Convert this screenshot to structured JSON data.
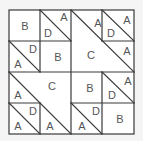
{
  "diagram": {
    "type": "tangram-grid-puzzle",
    "grid": {
      "rows": 4,
      "cols": 4
    },
    "colors": {
      "background": "#f5f5f5",
      "fill": "#ffffff",
      "stroke": "#3a3a3a",
      "text": "#555555"
    },
    "regions": [
      {
        "id": "r1",
        "label": "B",
        "shape": "square",
        "location": "row1-col1"
      },
      {
        "id": "r2",
        "label": "D",
        "shape": "triangle",
        "location": "row1-col2-lower-left"
      },
      {
        "id": "r3",
        "label": "A",
        "shape": "triangle",
        "location": "row1-col2-upper-right"
      },
      {
        "id": "r4",
        "label": "A",
        "shape": "triangle",
        "location": "top-right-block-top"
      },
      {
        "id": "r5",
        "label": "D",
        "shape": "triangle",
        "location": "row1-col4-lower-left"
      },
      {
        "id": "r6",
        "label": "A",
        "shape": "triangle",
        "location": "row1-col4-upper-right"
      },
      {
        "id": "r7",
        "label": "A",
        "shape": "triangle",
        "location": "row2-col4-upper-right"
      },
      {
        "id": "r8",
        "label": "C",
        "shape": "large-triangle",
        "location": "top-right-block-lower-left"
      },
      {
        "id": "r9",
        "label": "A",
        "shape": "triangle",
        "location": "row2-col1-lower-left"
      },
      {
        "id": "r10",
        "label": "D",
        "shape": "triangle",
        "location": "row2-col1-upper-right"
      },
      {
        "id": "r11",
        "label": "B",
        "shape": "square",
        "location": "row2-col2"
      },
      {
        "id": "r12",
        "label": "C",
        "shape": "large-triangle",
        "location": "bottom-left-block-upper-right"
      },
      {
        "id": "r13",
        "label": "A",
        "shape": "triangle",
        "location": "row3-col1-lower-left"
      },
      {
        "id": "r14",
        "label": "B",
        "shape": "square",
        "location": "row3-col3"
      },
      {
        "id": "r15",
        "label": "D",
        "shape": "triangle",
        "location": "row3-col4-lower-left"
      },
      {
        "id": "r16",
        "label": "A",
        "shape": "triangle",
        "location": "row3-col4-upper-right"
      },
      {
        "id": "r17",
        "label": "A",
        "shape": "triangle",
        "location": "row4-col1-lower-left"
      },
      {
        "id": "r18",
        "label": "D",
        "shape": "triangle",
        "location": "row4-col1-upper-right"
      },
      {
        "id": "r19",
        "label": "A",
        "shape": "triangle",
        "location": "row4-col2-lower-left"
      },
      {
        "id": "r20",
        "label": "A",
        "shape": "triangle",
        "location": "row4-col3-lower-left"
      },
      {
        "id": "r21",
        "label": "D",
        "shape": "triangle",
        "location": "row4-col3-upper-right"
      },
      {
        "id": "r22",
        "label": "B",
        "shape": "square",
        "location": "row4-col4"
      }
    ],
    "labels": {
      "r1": "B",
      "r2": "D",
      "r3": "A",
      "r4": "A",
      "r5": "D",
      "r6": "A",
      "r7": "A",
      "r8": "C",
      "r9": "A",
      "r10": "D",
      "r11": "B",
      "r12": "C",
      "r13": "A",
      "r14": "B",
      "r15": "D",
      "r16": "A",
      "r17": "A",
      "r18": "D",
      "r19": "A",
      "r20": "A",
      "r21": "D",
      "r22": "B"
    }
  }
}
